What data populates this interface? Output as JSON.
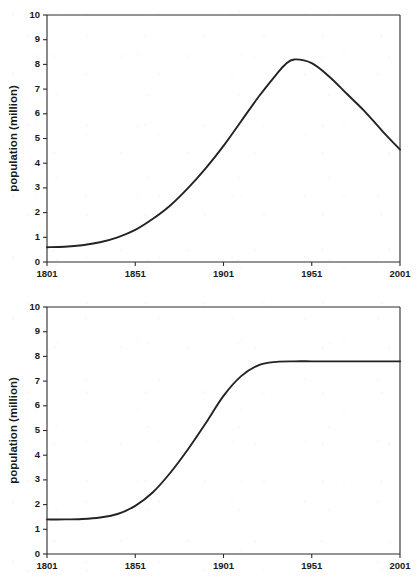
{
  "figures": [
    {
      "name": "population-decline-chart",
      "chart_data": {
        "type": "line",
        "title": "",
        "xlabel": "",
        "ylabel": "population (million)",
        "xlim": [
          1801,
          2001
        ],
        "ylim": [
          0,
          10
        ],
        "xticks": [
          1801,
          1851,
          1901,
          1951,
          2001
        ],
        "yticks": [
          0,
          1,
          2,
          3,
          4,
          5,
          6,
          7,
          8,
          9,
          10
        ],
        "grid": false,
        "legend": null,
        "series": [
          {
            "name": "population",
            "x": [
              1801,
              1811,
              1821,
              1831,
              1841,
              1851,
              1861,
              1871,
              1881,
              1891,
              1901,
              1911,
              1921,
              1931,
              1936,
              1941,
              1951,
              1961,
              1971,
              1981,
              1991,
              2001
            ],
            "values": [
              0.6,
              0.62,
              0.68,
              0.8,
              1.0,
              1.3,
              1.75,
              2.3,
              3.0,
              3.8,
              4.7,
              5.7,
              6.7,
              7.6,
              8.0,
              8.2,
              8.05,
              7.5,
              6.8,
              6.1,
              5.3,
              4.55
            ]
          }
        ]
      }
    },
    {
      "name": "population-growth-chart",
      "chart_data": {
        "type": "line",
        "title": "",
        "xlabel": "",
        "ylabel": "population (million)",
        "xlim": [
          1801,
          2001
        ],
        "ylim": [
          0,
          10
        ],
        "xticks": [
          1801,
          1851,
          1901,
          1951,
          2001
        ],
        "yticks": [
          0,
          1,
          2,
          3,
          4,
          5,
          6,
          7,
          8,
          9,
          10
        ],
        "grid": false,
        "legend": null,
        "series": [
          {
            "name": "population",
            "x": [
              1801,
              1811,
              1821,
              1831,
              1841,
              1851,
              1861,
              1871,
              1881,
              1891,
              1901,
              1911,
              1921,
              1931,
              1941,
              1951,
              1961,
              1971,
              1981,
              1991,
              2001
            ],
            "values": [
              1.4,
              1.4,
              1.42,
              1.48,
              1.62,
              1.95,
              2.5,
              3.3,
              4.25,
              5.3,
              6.4,
              7.2,
              7.65,
              7.78,
              7.8,
              7.8,
              7.8,
              7.8,
              7.8,
              7.8,
              7.8
            ]
          }
        ]
      }
    }
  ],
  "colors": {
    "curve": "#232323",
    "axis": "#2b2b2b",
    "text": "#1a1a1a",
    "background": "#ffffff"
  }
}
